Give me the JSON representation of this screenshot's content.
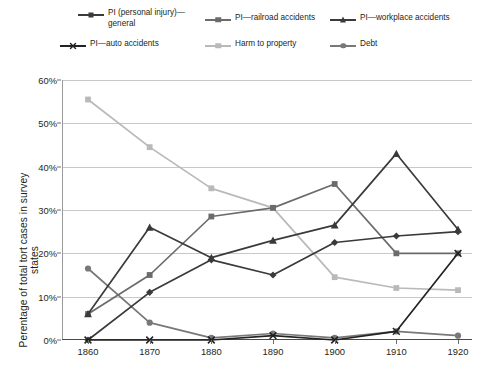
{
  "legend": {
    "items": [
      {
        "id": "pi-general",
        "label_line1": "PI (personal injury)—",
        "label_line2": "general",
        "marker": "diamond-marker",
        "color": "#3a3a3a"
      },
      {
        "id": "pi-railroad",
        "label_line1": "PI—railroad accidents",
        "label_line2": "",
        "marker": "square-marker",
        "color": "#6b6b6b"
      },
      {
        "id": "pi-workplace",
        "label_line1": "PI—workplace accidents",
        "label_line2": "",
        "marker": "triangle-marker",
        "color": "#3a3a3a"
      },
      {
        "id": "pi-auto",
        "label_line1": "PI—auto accidents",
        "label_line2": "",
        "marker": "x-marker",
        "color": "#222222"
      },
      {
        "id": "harm-property",
        "label_line1": "Harm to property",
        "label_line2": "",
        "marker": "square-marker",
        "color": "#b9b9b9"
      },
      {
        "id": "debt",
        "label_line1": "Debt",
        "label_line2": "",
        "marker": "circle-marker",
        "color": "#787878"
      }
    ]
  },
  "axes": {
    "ylabel": "Perentage of total tort cases in survey states",
    "yticks": [
      "0%",
      "10%",
      "20%",
      "30%",
      "40%",
      "50%",
      "60%"
    ],
    "xticks": [
      "1860",
      "1870",
      "1880",
      "1890",
      "1900",
      "1910",
      "1920"
    ]
  },
  "chart_data": {
    "type": "line",
    "title": "",
    "xlabel": "",
    "ylabel": "Perentage of total tort cases in survey states",
    "x": [
      1860,
      1870,
      1880,
      1890,
      1900,
      1910,
      1920
    ],
    "ylim": [
      0,
      60
    ],
    "yticks": [
      0,
      10,
      20,
      30,
      40,
      50,
      60
    ],
    "grid": "horizontal",
    "legend_position": "top",
    "series": [
      {
        "name": "PI (personal injury)—general",
        "marker": "diamond",
        "color": "#3a3a3a",
        "values": [
          0,
          11,
          18.5,
          15,
          22.5,
          24,
          25
        ]
      },
      {
        "name": "PI—railroad accidents",
        "marker": "square",
        "color": "#6b6b6b",
        "values": [
          6,
          15,
          28.5,
          30.5,
          36,
          20,
          20
        ]
      },
      {
        "name": "PI—workplace accidents",
        "marker": "triangle",
        "color": "#3a3a3a",
        "values": [
          6,
          26,
          19,
          23,
          26.5,
          43,
          25.5
        ]
      },
      {
        "name": "PI—auto accidents",
        "marker": "x",
        "color": "#222222",
        "values": [
          0,
          0,
          0,
          1,
          0,
          2,
          20
        ]
      },
      {
        "name": "Harm to property",
        "marker": "square",
        "color": "#b9b9b9",
        "values": [
          55.5,
          44.5,
          35,
          30.5,
          14.5,
          12,
          11.5
        ]
      },
      {
        "name": "Debt",
        "marker": "circle",
        "color": "#787878",
        "values": [
          16.5,
          4,
          0.5,
          1.5,
          0.5,
          2,
          1
        ]
      }
    ]
  }
}
